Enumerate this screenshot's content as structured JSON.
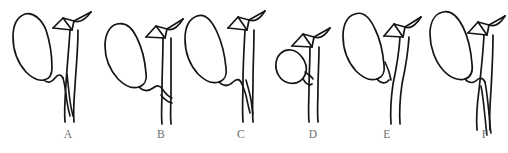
{
  "figure": {
    "background_color": "#ffffff",
    "stroke_color": "#151515",
    "label_color": "#6e6e6e",
    "caption": "",
    "panel_count": 6
  },
  "panels": [
    {
      "label": "A",
      "label_x": 68,
      "label_y": 134,
      "origin_x": 8,
      "variant_name": "low-parallel-cystic-duct-insertion",
      "gallbladder_shape": "elongated-pear",
      "cystic_duct_course": "parallel-descending-low-union"
    },
    {
      "label": "B",
      "label_x": 161,
      "label_y": 134,
      "origin_x": 96,
      "variant_name": "oblique-low-cystic-duct-insertion",
      "gallbladder_shape": "elongated-pear",
      "cystic_duct_course": "oblique-low-union"
    },
    {
      "label": "C",
      "label_x": 241,
      "label_y": 134,
      "origin_x": 176,
      "variant_name": "short-cystic-duct-mid-insertion",
      "gallbladder_shape": "elongated-pear",
      "cystic_duct_course": "short-mid-union"
    },
    {
      "label": "D",
      "label_x": 313,
      "label_y": 134,
      "origin_x": 258,
      "variant_name": "small-round-high-gallbladder",
      "gallbladder_shape": "small-round",
      "cystic_duct_course": "short-high-union"
    },
    {
      "label": "E",
      "label_x": 387,
      "label_y": 134,
      "origin_x": 330,
      "variant_name": "high-cystic-duct-insertion",
      "gallbladder_shape": "elongated-pear",
      "cystic_duct_course": "high-union"
    },
    {
      "label": "F",
      "label_x": 485,
      "label_y": 134,
      "origin_x": 416,
      "variant_name": "long-parallel-cystic-duct",
      "gallbladder_shape": "elongated-pear",
      "cystic_duct_course": "long-parallel-descending"
    }
  ],
  "structures": {
    "gallbladder": "gallbladder",
    "cystic_duct": "cystic-duct",
    "common_bile_duct": "common-bile-duct",
    "hepatic_duct_tree": "hepatic-duct-tree"
  }
}
